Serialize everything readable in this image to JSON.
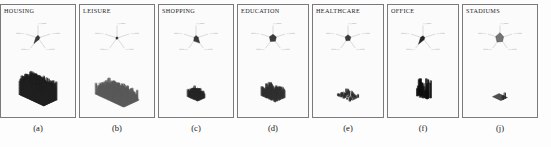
{
  "figure": {
    "background_color": "#fdfdfd",
    "border_color": "#7a7a7a",
    "ink_color": "#1c1c1c"
  },
  "panels": [
    {
      "title": "HOUSING",
      "caption": "(a)",
      "width_px": 76,
      "radar": {
        "axis_labels": [
          "",
          "",
          "",
          "",
          ""
        ],
        "values": [
          0.22,
          0.16,
          0.14,
          0.55,
          0.18
        ],
        "fill_color": "#2b2b2b"
      },
      "plot": {
        "type": "bar3d-dense-spikes",
        "density": "very-high",
        "height_profile": "tall-uniform",
        "base_plane": true,
        "base_color": "#3a3a3a",
        "mark_color": "#202020",
        "columns": 26,
        "rows": 14,
        "fill_ratio": 1.0,
        "mean_height": 0.82,
        "height_variation": 0.18
      }
    },
    {
      "title": "LEISURE",
      "caption": "(b)",
      "width_px": 76,
      "radar": {
        "axis_labels": [
          "",
          "",
          "",
          "",
          ""
        ],
        "values": [
          0.1,
          0.1,
          0.1,
          0.12,
          0.1
        ],
        "fill_color": "#2b2b2b"
      },
      "plot": {
        "type": "bar3d-dense-spikes",
        "density": "very-high",
        "height_profile": "short-fuzzy",
        "base_plane": false,
        "base_color": "#6d6d6d",
        "mark_color": "#5a5a5a",
        "columns": 30,
        "rows": 16,
        "fill_ratio": 1.0,
        "mean_height": 0.3,
        "height_variation": 0.3
      }
    },
    {
      "title": "SHOPPING",
      "caption": "(c)",
      "width_px": 76,
      "radar": {
        "axis_labels": [
          "",
          "",
          "",
          "",
          ""
        ],
        "values": [
          0.2,
          0.18,
          0.5,
          0.3,
          0.16
        ],
        "fill_color": "#2b2b2b"
      },
      "plot": {
        "type": "bar3d-lattice",
        "density": "medium",
        "height_profile": "regular-grid",
        "base_plane": false,
        "base_color": "#4a4a4a",
        "mark_color": "#262626",
        "columns": 11,
        "rows": 8,
        "fill_ratio": 0.85,
        "mean_height": 0.3,
        "height_variation": 0.12
      }
    },
    {
      "title": "EDUCATION",
      "caption": "(d)",
      "width_px": 72,
      "radar": {
        "axis_labels": [
          "",
          "",
          "",
          "",
          ""
        ],
        "values": [
          0.3,
          0.28,
          0.32,
          0.35,
          0.3
        ],
        "fill_color": "#2b2b2b"
      },
      "plot": {
        "type": "bar3d-clustered",
        "density": "medium-high",
        "height_profile": "clustered-blobs",
        "base_plane": false,
        "base_color": "#4a4a4a",
        "mark_color": "#303030",
        "columns": 16,
        "rows": 11,
        "fill_ratio": 0.7,
        "mean_height": 0.34,
        "height_variation": 0.26
      }
    },
    {
      "title": "HEALTHCARE",
      "caption": "(e)",
      "width_px": 72,
      "radar": {
        "axis_labels": [
          "",
          "",
          "",
          "",
          ""
        ],
        "values": [
          0.26,
          0.24,
          0.25,
          0.27,
          0.24
        ],
        "fill_color": "#2b2b2b"
      },
      "plot": {
        "type": "bar3d-sparse-scatter",
        "density": "low",
        "height_profile": "sparse-points",
        "base_plane": false,
        "base_color": "#5a5a5a",
        "mark_color": "#2a2a2a",
        "columns": 14,
        "rows": 10,
        "fill_ratio": 0.24,
        "mean_height": 0.14,
        "height_variation": 0.1
      }
    },
    {
      "title": "OFFICE",
      "caption": "(f)",
      "width_px": 72,
      "radar": {
        "axis_labels": [
          "",
          "",
          "",
          "",
          ""
        ],
        "values": [
          0.18,
          0.15,
          0.16,
          0.62,
          0.2
        ],
        "fill_color": "#151515"
      },
      "plot": {
        "type": "bar3d-sparse-towers",
        "density": "low",
        "height_profile": "tall-sparse-towers",
        "base_plane": false,
        "base_color": "#4a4a4a",
        "mark_color": "#101010",
        "columns": 13,
        "rows": 6,
        "fill_ratio": 0.3,
        "mean_height": 0.72,
        "height_variation": 0.4
      }
    },
    {
      "title": "STADIUMS",
      "caption": "(j)",
      "width_px": 76,
      "radar": {
        "axis_labels": [
          "",
          "",
          "",
          "",
          ""
        ],
        "values": [
          0.42,
          0.3,
          0.34,
          0.4,
          0.36
        ],
        "fill_color": "#6a6a6a"
      },
      "plot": {
        "type": "bar3d-flat-plane",
        "density": "very-low",
        "height_profile": "flat-plane-few-blobs",
        "base_plane": true,
        "base_color": "#4f4f4f",
        "mark_color": "#2a2a2a",
        "columns": 9,
        "rows": 7,
        "fill_ratio": 0.1,
        "mean_height": 0.2,
        "height_variation": 0.12
      }
    }
  ]
}
